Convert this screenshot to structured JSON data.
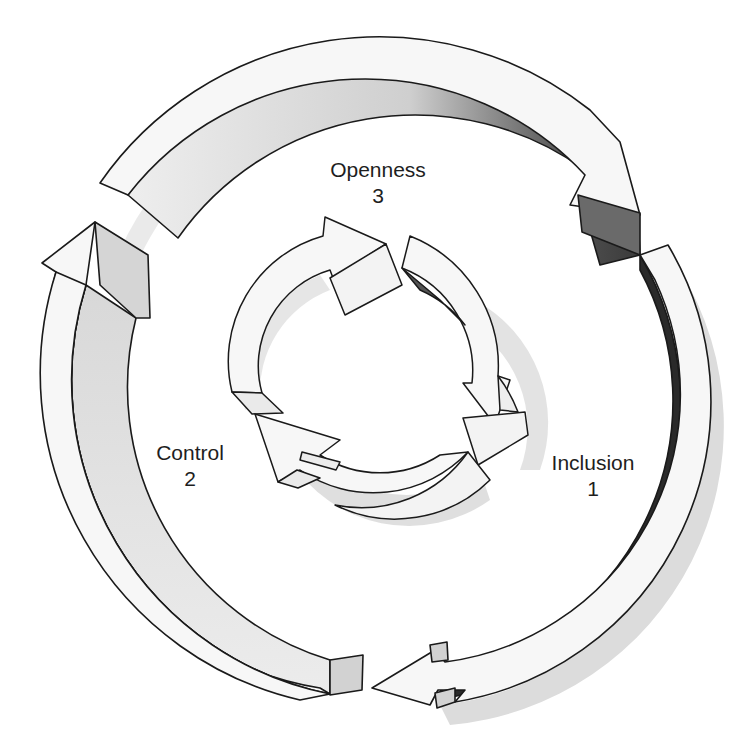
{
  "diagram": {
    "type": "cycle",
    "stages": [
      {
        "name": "Inclusion",
        "number": "1"
      },
      {
        "name": "Control",
        "number": "2"
      },
      {
        "name": "Openness",
        "number": "3"
      }
    ],
    "outer_ring": {
      "arrows": 3,
      "direction": "clockwise"
    },
    "inner_ring": {
      "arrows": 3,
      "direction": "clockwise"
    },
    "colors": {
      "face": "#f7f7f7",
      "outline": "#1a1a1a",
      "shadow": "#d9d9d9",
      "side_light": "#d2d2d2",
      "side_dark": "#5a5a5a"
    }
  }
}
